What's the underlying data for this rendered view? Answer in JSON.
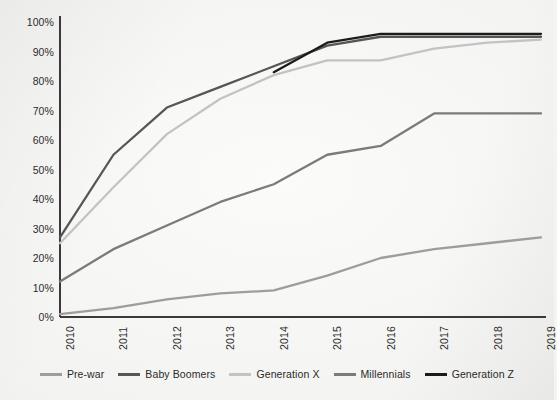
{
  "chart_data": {
    "type": "line",
    "title": "",
    "subtitle": "",
    "xlabel": "",
    "ylabel": "",
    "x": [
      "2010",
      "2011",
      "2012",
      "2013",
      "2014",
      "2015",
      "2016",
      "2017",
      "2018",
      "2019"
    ],
    "xlim": [
      2010,
      2019
    ],
    "ylim": [
      0,
      100
    ],
    "yticks": [
      0,
      10,
      20,
      30,
      40,
      50,
      60,
      70,
      80,
      90,
      100
    ],
    "ytick_labels": [
      "0%",
      "10%",
      "20%",
      "30%",
      "40%",
      "50%",
      "60%",
      "70%",
      "80%",
      "90%",
      "100%"
    ],
    "grid": false,
    "legend_position": "bottom",
    "value_suffix": "%",
    "series": [
      {
        "name": "Pre-war",
        "color": "#9d9d9d",
        "x": [
          "2010",
          "2011",
          "2012",
          "2013",
          "2014",
          "2015",
          "2016",
          "2017",
          "2018",
          "2019"
        ],
        "values": [
          1,
          3,
          6,
          8,
          9,
          14,
          20,
          23,
          25,
          27
        ]
      },
      {
        "name": "Baby Boomers",
        "color": "#565656",
        "x": [
          "2010",
          "2011",
          "2012",
          "2013",
          "2014",
          "2015",
          "2016",
          "2017",
          "2018",
          "2019"
        ],
        "values": [
          27,
          55,
          71,
          78,
          85,
          92,
          95,
          95,
          95,
          95
        ]
      },
      {
        "name": "Generation X",
        "color": "#c3c3c3",
        "x": [
          "2010",
          "2011",
          "2012",
          "2013",
          "2014",
          "2015",
          "2016",
          "2017",
          "2018",
          "2019"
        ],
        "values": [
          25,
          44,
          62,
          74,
          82,
          87,
          87,
          91,
          93,
          94
        ]
      },
      {
        "name": "Millennials",
        "color": "#7b7b7b",
        "x": [
          "2010",
          "2011",
          "2012",
          "2013",
          "2014",
          "2015",
          "2016",
          "2017",
          "2018",
          "2019"
        ],
        "values": [
          12,
          23,
          31,
          39,
          45,
          55,
          58,
          69,
          69,
          69
        ]
      },
      {
        "name": "Generation Z",
        "color": "#1c1c1c",
        "x": [
          "2014",
          "2015",
          "2016",
          "2017",
          "2018",
          "2019"
        ],
        "values": [
          83,
          93,
          96,
          96,
          96,
          96
        ]
      }
    ]
  },
  "axis": {
    "line_color": "#3a3a3a",
    "tick_text_color": "#2c2c2c"
  },
  "legend": {
    "items": [
      {
        "label": "Pre-war"
      },
      {
        "label": "Baby Boomers"
      },
      {
        "label": "Generation X"
      },
      {
        "label": "Millennials"
      },
      {
        "label": "Generation Z"
      }
    ]
  }
}
